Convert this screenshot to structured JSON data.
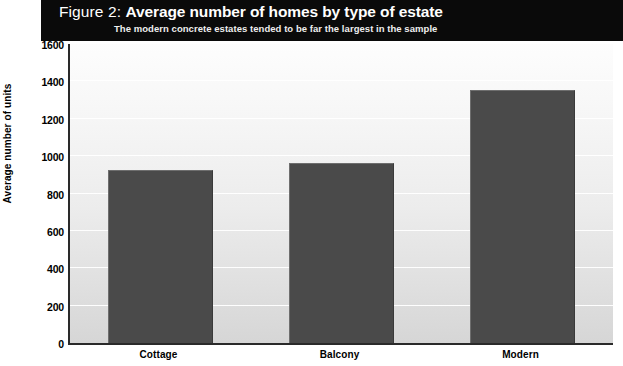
{
  "header": {
    "figure_label": "Figure 2:",
    "title": "Average number of homes by type of estate",
    "subtitle": "The modern concrete estates tended to be far the largest in the sample"
  },
  "chart_data": {
    "type": "bar",
    "title": "Average number of homes by type of estate",
    "subtitle": "The modern concrete estates tended to be far the largest in the sample",
    "figure_label": "Figure 2:",
    "categories": [
      "Cottage",
      "Balcony",
      "Modern"
    ],
    "values": [
      925,
      965,
      1355
    ],
    "xlabel": "",
    "ylabel": "Average number of units",
    "ylim": [
      0,
      1600
    ],
    "ytick_step": 200,
    "yticks": [
      0,
      200,
      400,
      600,
      800,
      1000,
      1200,
      1400,
      1600
    ],
    "ytick_labels": [
      "0",
      "200",
      "400",
      "600",
      "800",
      "1000",
      "1200",
      "1400",
      "1600"
    ],
    "grid": true,
    "grid_axis": "y",
    "legend": false,
    "legend_position": "none",
    "bar_color": "#4a4a4a",
    "plot_background": "#ececec",
    "header_background": "#0a0a0a",
    "header_text_color": "#ffffff"
  },
  "colors": {
    "bar": "#4a4a4a",
    "header_band": "#0a0a0a",
    "axis": "#2a2a2a",
    "gridline": "#ffffff",
    "text": "#000000"
  }
}
